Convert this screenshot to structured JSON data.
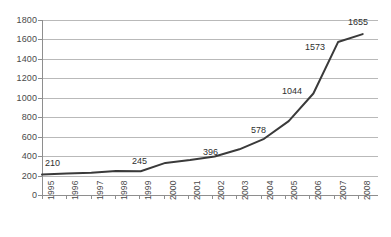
{
  "chart_data": {
    "type": "line",
    "title": "",
    "subtitle": "",
    "xlabel": "",
    "ylabel": "",
    "categories": [
      "1995",
      "1996",
      "1997",
      "1998",
      "1999",
      "2000",
      "2001",
      "2002",
      "2003",
      "2004",
      "2005",
      "2006",
      "2007",
      "2008"
    ],
    "values": [
      210,
      222,
      228,
      248,
      245,
      330,
      360,
      396,
      470,
      578,
      760,
      1044,
      1573,
      1655
    ],
    "ylim": [
      0,
      1800
    ],
    "ytick_step": 200,
    "yticks": [
      "0",
      "200",
      "400",
      "600",
      "800",
      "1000",
      "1200",
      "1400",
      "1600",
      "1800"
    ],
    "grid": true,
    "legend": "none",
    "series_color": "#3a3a3a",
    "gridline_color": "#b9b9b9",
    "axis_color": "#8e8e8e",
    "data_labels": [
      {
        "category": "1995",
        "value": "210"
      },
      {
        "category": "1999",
        "value": "245"
      },
      {
        "category": "2002",
        "value": "396"
      },
      {
        "category": "2004",
        "value": "578"
      },
      {
        "category": "2006",
        "value": "1044"
      },
      {
        "category": "2007",
        "value": "1573"
      },
      {
        "category": "2008",
        "value": "1655"
      }
    ]
  }
}
